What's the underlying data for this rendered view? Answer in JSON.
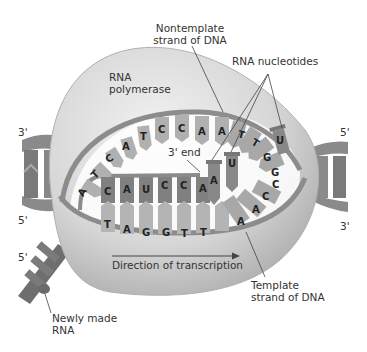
{
  "labels": {
    "nontemplate": [
      "Nontemplate",
      "strand of DNA"
    ],
    "rna_nucleotides": "RNA nucleotides",
    "rna_polymerase": [
      "RNA",
      "polymerase"
    ],
    "three_prime_end": "3' end",
    "direction": "Direction of transcription",
    "template": [
      "Template",
      "strand of DNA"
    ],
    "newly_made_rna": [
      "Newly made",
      "RNA"
    ],
    "left_top_end": "3'",
    "left_bottom_end": "5'",
    "rna_5_end": "5'",
    "right_top_end": "5'",
    "right_bottom_end": "3'"
  },
  "sequences": {
    "nontemplate_strand": [
      "A",
      "T",
      "C",
      "A",
      "T",
      "C",
      "C",
      "A",
      "A",
      "T",
      "T",
      "G",
      "G"
    ],
    "rna_strand": [
      "C",
      "A",
      "U",
      "C",
      "C",
      "A"
    ],
    "template_strand": [
      "T",
      "A",
      "G",
      "G",
      "T",
      "T",
      "A",
      "A",
      "C",
      "C"
    ],
    "incoming_nucleotides": [
      "A",
      "U",
      "U"
    ]
  },
  "colors": {
    "polymerase": "#d8d8d8",
    "strand": "#8c8c8c",
    "base_light": "#b4b4b4",
    "base_dark": "#7e7e7e",
    "text": "#333333"
  }
}
